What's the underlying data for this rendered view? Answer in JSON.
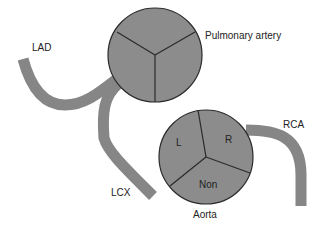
{
  "diagram": {
    "labels": {
      "lad": "LAD",
      "lcx": "LCX",
      "rca": "RCA",
      "pulmonary": "Pulmonary artery",
      "aorta": "Aorta",
      "cusp_left": "L",
      "cusp_right": "R",
      "cusp_non": "Non"
    },
    "colors": {
      "vessel": "#868686",
      "valve_fill": "#8c8c8c",
      "outline": "#2a2a2a",
      "background": "#ffffff"
    }
  }
}
